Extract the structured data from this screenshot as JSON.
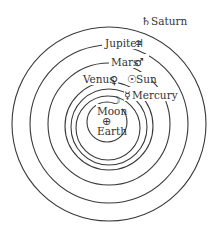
{
  "diagram": {
    "center": {
      "x": 109,
      "y": 124
    },
    "stroke_color": "#3a3a3a",
    "orbits": [
      {
        "name": "Moon",
        "r": 20
      },
      {
        "name": "Mercury",
        "r": 32
      },
      {
        "name": "Venus",
        "r": 38
      },
      {
        "name": "Sun",
        "r": 44
      },
      {
        "name": "Mars",
        "r": 61
      },
      {
        "name": "Jupiter",
        "r": 79
      },
      {
        "name": "Saturn",
        "r": 97
      }
    ],
    "bodies": [
      {
        "name": "Saturn",
        "label": "Saturn",
        "symbol": "♄",
        "symbol_name": "saturn-symbol"
      },
      {
        "name": "Jupiter",
        "label": "Jupiter",
        "symbol": "♃",
        "symbol_name": "jupiter-symbol"
      },
      {
        "name": "Mars",
        "label": "Mars",
        "symbol": "♂",
        "symbol_name": "mars-symbol"
      },
      {
        "name": "Venus",
        "label": "Venus",
        "symbol": "♀",
        "symbol_name": "venus-symbol"
      },
      {
        "name": "Sun",
        "label": "Sun",
        "symbol": "☉",
        "symbol_name": "sun-symbol"
      },
      {
        "name": "Mercury",
        "label": "Mercury",
        "symbol": "☿",
        "symbol_name": "mercury-symbol"
      },
      {
        "name": "Moon",
        "label": "Moon",
        "symbol": "☽",
        "symbol_name": "moon-symbol"
      },
      {
        "name": "Earth",
        "label": "Earth",
        "symbol": "⊕",
        "symbol_name": "earth-symbol"
      }
    ]
  }
}
